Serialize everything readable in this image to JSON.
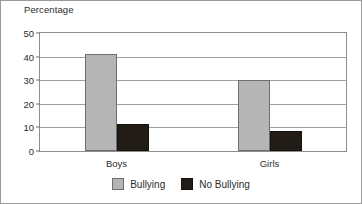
{
  "chart_data": {
    "type": "bar",
    "title": "",
    "xlabel": "",
    "ylabel": "Percentage",
    "categories": [
      "Boys",
      "Girls"
    ],
    "series": [
      {
        "name": "Bullying",
        "color": "#b5b5b5",
        "values": [
          41,
          30
        ]
      },
      {
        "name": "No Bullying",
        "color": "#211c16",
        "values": [
          11.5,
          8.5
        ]
      }
    ],
    "ylim": [
      0,
      50
    ],
    "yticks": [
      0,
      10,
      20,
      30,
      40,
      50
    ],
    "ytick_labels": [
      "0",
      "10",
      "20",
      "30",
      "40",
      "50"
    ],
    "grid": "horizontal",
    "legend_position": "bottom-center"
  }
}
